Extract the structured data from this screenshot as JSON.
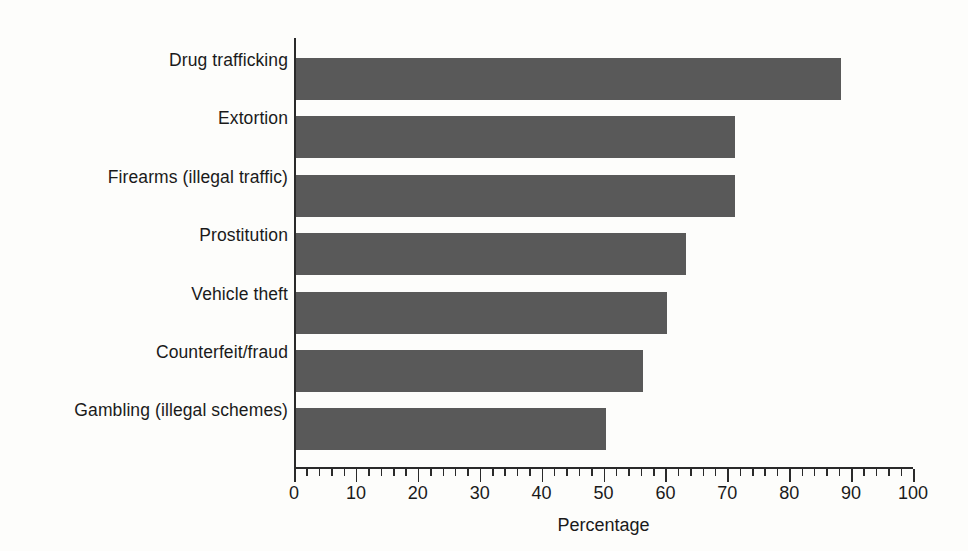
{
  "chart_data": {
    "type": "bar",
    "orientation": "horizontal",
    "title": "",
    "subtitle": "",
    "xlabel": "Percentage",
    "ylabel": "",
    "categories": [
      "Drug trafficking",
      "Extortion",
      "Firearms (illegal traffic)",
      "Prostitution",
      "Vehicle theft",
      "Counterfeit/fraud",
      "Gambling (illegal schemes)"
    ],
    "values": [
      88,
      71,
      71,
      63,
      60,
      56,
      50
    ],
    "xlim": [
      0,
      100
    ],
    "xticks": [
      0,
      10,
      20,
      30,
      40,
      50,
      60,
      70,
      80,
      90,
      100
    ],
    "xtick_labels": [
      "0",
      "10",
      "20",
      "30",
      "40",
      "50",
      "60",
      "70",
      "80",
      "90",
      "100"
    ],
    "minor_tick_step": 2,
    "grid": false,
    "legend": false,
    "legend_position": "none",
    "bar_color": "#595959",
    "axis_color": "#2a2a2a",
    "background_color": "#fdfdfb"
  }
}
